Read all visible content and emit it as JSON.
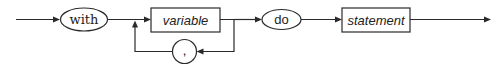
{
  "diagram": {
    "type": "syntax-diagram",
    "statement": "with-statement",
    "nodes": [
      {
        "id": "with",
        "kind": "terminal",
        "label": "with"
      },
      {
        "id": "variable",
        "kind": "nonterminal",
        "label": "variable"
      },
      {
        "id": "comma",
        "kind": "terminal",
        "label": ","
      },
      {
        "id": "do",
        "kind": "terminal",
        "label": "do"
      },
      {
        "id": "statement",
        "kind": "nonterminal",
        "label": "statement"
      }
    ],
    "edges": [
      {
        "from": "entry",
        "to": "with"
      },
      {
        "from": "with",
        "to": "variable"
      },
      {
        "from": "variable",
        "to": "comma",
        "note": "loop back"
      },
      {
        "from": "comma",
        "to": "variable"
      },
      {
        "from": "variable",
        "to": "do"
      },
      {
        "from": "do",
        "to": "statement"
      },
      {
        "from": "statement",
        "to": "exit"
      }
    ],
    "colors": {
      "stroke": "#2a2a2a",
      "background": "#ffffff"
    }
  }
}
